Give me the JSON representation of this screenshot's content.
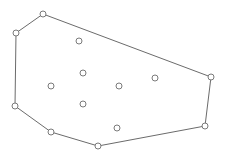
{
  "diagram": {
    "type": "convex-hull",
    "colors": {
      "background": "#ffffff",
      "stroke": "#6b6b6b",
      "point_fill": "#ffffff",
      "point_stroke": "#7a7a7a"
    },
    "point_radius": 3,
    "hull_vertices": [
      {
        "x": 43,
        "y": 14
      },
      {
        "x": 16,
        "y": 33
      },
      {
        "x": 15,
        "y": 106
      },
      {
        "x": 51,
        "y": 132
      },
      {
        "x": 98,
        "y": 146
      },
      {
        "x": 205,
        "y": 126
      },
      {
        "x": 211,
        "y": 77
      }
    ],
    "interior_points": [
      {
        "x": 79,
        "y": 41
      },
      {
        "x": 83,
        "y": 73
      },
      {
        "x": 51,
        "y": 86
      },
      {
        "x": 119,
        "y": 86
      },
      {
        "x": 155,
        "y": 78
      },
      {
        "x": 83,
        "y": 104
      },
      {
        "x": 117,
        "y": 128
      }
    ]
  }
}
